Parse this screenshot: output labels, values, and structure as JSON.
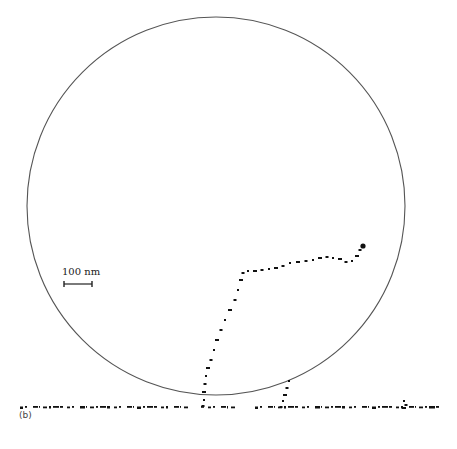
{
  "figure": {
    "panel_label": "(b)",
    "scale_bar": {
      "label": "100 nm",
      "x1": 64,
      "x2": 92,
      "y": 284
    },
    "circle": {
      "cx": 216,
      "cy": 206,
      "r": 189,
      "stroke": "#555555"
    },
    "trajectory_color": "#111111",
    "substrate_line": {
      "y": 407,
      "x_start": 20,
      "x_end": 437
    },
    "trajectory_main": [
      [
        363,
        246
      ],
      [
        360,
        250
      ],
      [
        357,
        256
      ],
      [
        352,
        261
      ],
      [
        346,
        262
      ],
      [
        340,
        259
      ],
      [
        333,
        258
      ],
      [
        327,
        257
      ],
      [
        320,
        258
      ],
      [
        313,
        260
      ],
      [
        306,
        261
      ],
      [
        298,
        262
      ],
      [
        290,
        263
      ],
      [
        283,
        266
      ],
      [
        276,
        268
      ],
      [
        269,
        269
      ],
      [
        262,
        270
      ],
      [
        255,
        271
      ],
      [
        248,
        271
      ],
      [
        243,
        273
      ],
      [
        241,
        280
      ],
      [
        238,
        290
      ],
      [
        235,
        300
      ],
      [
        230,
        310
      ],
      [
        225,
        320
      ],
      [
        221,
        330
      ],
      [
        217,
        340
      ],
      [
        214,
        350
      ],
      [
        211,
        360
      ],
      [
        208,
        368
      ],
      [
        206,
        376
      ],
      [
        205,
        384
      ],
      [
        204,
        392
      ],
      [
        204,
        400
      ],
      [
        203,
        406
      ]
    ],
    "trajectory_branch": [
      [
        289,
        381
      ],
      [
        287,
        388
      ],
      [
        285,
        395
      ],
      [
        283,
        401
      ],
      [
        281,
        407
      ]
    ],
    "bottom_blob": [
      [
        404,
        401
      ],
      [
        406,
        405
      ],
      [
        404,
        408
      ]
    ]
  }
}
